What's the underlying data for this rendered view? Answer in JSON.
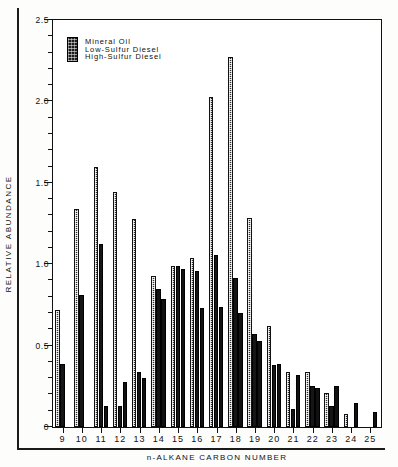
{
  "chart_data": {
    "type": "bar",
    "title": "",
    "xlabel": "n-ALKANE CARBON NUMBER",
    "ylabel": "RELATIVE ABUNDANCE",
    "categories": [
      "9",
      "10",
      "11",
      "12",
      "13",
      "14",
      "15",
      "16",
      "17",
      "18",
      "19",
      "20",
      "21",
      "22",
      "23",
      "24",
      "25"
    ],
    "ylim": [
      0,
      2.5
    ],
    "yticks": [
      "0",
      "0.5",
      "1.0",
      "1.5",
      "2.0",
      "2.5"
    ],
    "ytick_values": [
      0,
      0.5,
      1.0,
      1.5,
      2.0,
      2.5
    ],
    "minor_tick_step": 0.1,
    "grid": false,
    "legend_position": "top-left inside plot",
    "series": [
      {
        "name": "Mineral Oil",
        "pattern": "stippled",
        "color": "#2c2c2c",
        "values": [
          0.72,
          1.34,
          1.6,
          1.45,
          1.28,
          0.93,
          0.99,
          1.04,
          2.03,
          2.28,
          1.29,
          0.62,
          0.34,
          0.34,
          0.21,
          0.08,
          0.0
        ]
      },
      {
        "name": "Low-Sulfur Diesel",
        "pattern": "solid-dark",
        "color": "#151515",
        "values": [
          0.39,
          0.81,
          1.13,
          0.13,
          0.34,
          0.85,
          0.99,
          0.96,
          1.06,
          0.92,
          0.57,
          0.38,
          0.11,
          0.25,
          0.13,
          0.0,
          0.0
        ]
      },
      {
        "name": "High-Sulfur Diesel",
        "pattern": "solid-black",
        "color": "#111111",
        "values": [
          0.0,
          0.0,
          0.13,
          0.28,
          0.3,
          0.79,
          0.97,
          0.73,
          0.74,
          0.7,
          0.53,
          0.39,
          0.32,
          0.24,
          0.25,
          0.15,
          0.09
        ]
      }
    ]
  },
  "legend": {
    "entries": [
      "Mineral Oil",
      "Low-Sulfur Diesel",
      "High-Sulfur Diesel"
    ]
  }
}
